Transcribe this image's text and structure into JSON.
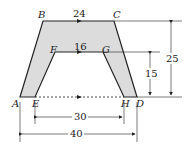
{
  "figure": {
    "shape_fill": "#dcdcdc",
    "stroke": "#222222",
    "points": {
      "A": {
        "label": "A"
      },
      "B": {
        "label": "B"
      },
      "C": {
        "label": "C"
      },
      "D": {
        "label": "D"
      },
      "E": {
        "label": "E"
      },
      "F": {
        "label": "F"
      },
      "G": {
        "label": "G"
      },
      "H": {
        "label": "H"
      }
    },
    "dimensions": {
      "top_BC": "24",
      "inner_FG": "16",
      "height_inner": "15",
      "height_outer": "25",
      "bottom_EH": "30",
      "bottom_AD": "40"
    }
  }
}
